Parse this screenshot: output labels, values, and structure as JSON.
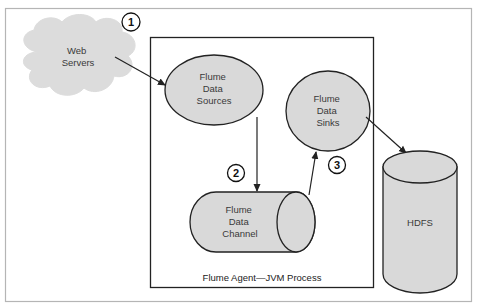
{
  "diagram": {
    "title": "Flume Agent—JVM Process",
    "colors": {
      "node_fill": "#d9d9d9",
      "cloud_fill": "#dcdcdc",
      "stroke": "#222222",
      "frame": "#b5b5b5"
    },
    "nodes": {
      "web_servers": {
        "line1": "Web",
        "line2": "Servers"
      },
      "sources": {
        "line1": "Flume",
        "line2": "Data",
        "line3": "Sources"
      },
      "sinks": {
        "line1": "Flume",
        "line2": "Data",
        "line3": "Sinks"
      },
      "channel": {
        "line1": "Flume",
        "line2": "Data",
        "line3": "Channel"
      },
      "hdfs": {
        "line1": "HDFS"
      }
    },
    "steps": [
      {
        "label": "1"
      },
      {
        "label": "2"
      },
      {
        "label": "3"
      }
    ],
    "edges": [
      {
        "from": "Web Servers",
        "to": "Flume Data Sources"
      },
      {
        "from": "Flume Data Sources",
        "to": "Flume Data Channel"
      },
      {
        "from": "Flume Data Channel",
        "to": "Flume Data Sinks"
      },
      {
        "from": "Flume Data Sinks",
        "to": "HDFS"
      }
    ]
  }
}
